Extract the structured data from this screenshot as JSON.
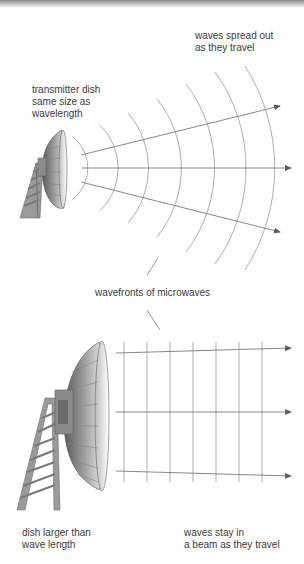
{
  "diagram": {
    "labels": {
      "top_waves": "waves spread out\nas they travel",
      "top_dish": "transmitter dish\nsame size as\nwavelength",
      "wavefronts": "wavefronts of microwaves",
      "bottom_dish": "dish larger than\nwave length",
      "bottom_waves": "waves stay in\na beam as they travel"
    },
    "panels": [
      {
        "name": "small-dish",
        "dish": "small parabolic dish on lattice tower",
        "wave_pattern": "diverging curved wavefronts",
        "wavefront_count": 7,
        "arrows": 3
      },
      {
        "name": "large-dish",
        "dish": "large parabolic dish on lattice tower",
        "wave_pattern": "parallel straight wavefronts",
        "wavefront_count": 7,
        "arrows": 3
      }
    ],
    "colors": {
      "wave": "#9a9a9a",
      "arrow": "#666666",
      "dish_dark": "#6e6e6e",
      "dish_light": "#f4f4f4",
      "tower": "#8c8c8c",
      "text": "#3a3a3a"
    }
  }
}
